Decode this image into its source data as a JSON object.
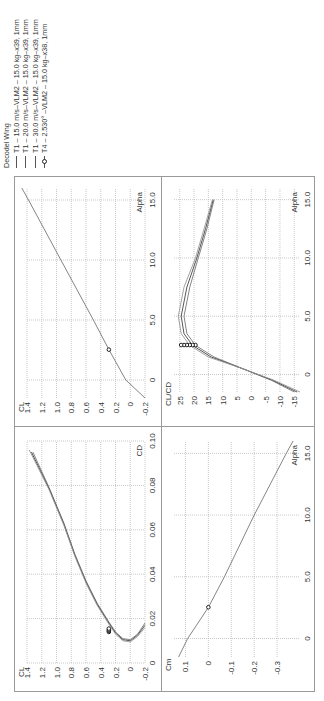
{
  "figure": {
    "orientation": "rotated 90 degrees counter-clockwise",
    "legend": {
      "title": "Decodel Wing",
      "entries": [
        {
          "label": "T1 – 15.0 m/s–VLM2 – 15.0 kg–x39, 1mm",
          "color": "#777777",
          "marker": "none"
        },
        {
          "label": "T1 – 20.0 m/s–VLM2 – 15.0 kg–x39, 1mm",
          "color": "#444444",
          "marker": "none"
        },
        {
          "label": "T1 – 30.0 m/s–VLM2 – 15.0 kg–x39, 1mm",
          "color": "#999999",
          "marker": "none"
        },
        {
          "label": "T4 – 2.530° –VLM2 – 15.0 kg–x38, 1mm",
          "color": "#222222",
          "marker": "circle"
        }
      ]
    }
  },
  "chart_data": [
    {
      "type": "line",
      "title": "CL vs CD (polar)",
      "xlabel": "CD",
      "ylabel": "CL",
      "xlim": [
        0,
        0.1
      ],
      "ylim": [
        -0.2,
        1.4
      ],
      "xticks": [
        "0",
        "0.02",
        "0.04",
        "0.06",
        "0.08",
        "0.10"
      ],
      "yticks": [
        "1.4",
        "1.2",
        "1.0",
        "0.8",
        "0.6",
        "0.4",
        "0.2",
        "0",
        "-0.2"
      ],
      "grid": true,
      "series": [
        {
          "name": "T1 – 15.0 m/s",
          "x": [
            0.018,
            0.013,
            0.0105,
            0.011,
            0.014,
            0.019,
            0.027,
            0.037,
            0.049,
            0.063,
            0.079,
            0.095
          ],
          "y": [
            -0.2,
            -0.1,
            0.0,
            0.1,
            0.2,
            0.3,
            0.45,
            0.6,
            0.75,
            0.9,
            1.1,
            1.32
          ]
        },
        {
          "name": "T1 – 20.0 m/s",
          "x": [
            0.017,
            0.0125,
            0.01,
            0.0105,
            0.0135,
            0.0185,
            0.0265,
            0.0365,
            0.0485,
            0.0625,
            0.0785,
            0.095
          ],
          "y": [
            -0.2,
            -0.1,
            0.0,
            0.1,
            0.2,
            0.3,
            0.45,
            0.6,
            0.75,
            0.9,
            1.1,
            1.34
          ]
        },
        {
          "name": "T1 – 30.0 m/s",
          "x": [
            0.016,
            0.012,
            0.0095,
            0.01,
            0.013,
            0.018,
            0.026,
            0.036,
            0.048,
            0.062,
            0.078,
            0.096
          ],
          "y": [
            -0.2,
            -0.1,
            0.0,
            0.1,
            0.2,
            0.3,
            0.45,
            0.6,
            0.75,
            0.9,
            1.1,
            1.37
          ]
        },
        {
          "name": "T4 – 2.530°",
          "x": [
            0.014,
            0.0145,
            0.015,
            0.0155
          ],
          "y": [
            0.29,
            0.29,
            0.29,
            0.29
          ],
          "marker": "circle"
        }
      ]
    },
    {
      "type": "line",
      "title": "CL vs Alpha",
      "xlabel": "Alpha",
      "ylabel": "CL",
      "xlim": [
        -1.5,
        16
      ],
      "ylim": [
        -0.2,
        1.4
      ],
      "xticks": [
        "0",
        "5.0",
        "10.0",
        "15.0"
      ],
      "yticks": [
        "1.4",
        "1.2",
        "1.0",
        "0.8",
        "0.6",
        "0.4",
        "0.2",
        "0",
        "-0.2"
      ],
      "grid": true,
      "series": [
        {
          "name": "T1 (all speeds)",
          "x": [
            -1.5,
            0,
            2.53,
            5,
            10,
            15,
            16
          ],
          "y": [
            -0.2,
            0.06,
            0.29,
            0.5,
            0.94,
            1.38,
            1.47
          ]
        },
        {
          "name": "T4 – 2.530°",
          "x": [
            2.53
          ],
          "y": [
            0.29
          ],
          "marker": "circle"
        }
      ]
    },
    {
      "type": "line",
      "title": "Cm vs Alpha",
      "xlabel": "Alpha",
      "ylabel": "Cm",
      "xlim": [
        -1.5,
        16
      ],
      "ylim": [
        -0.4,
        0.15
      ],
      "xticks": [
        "0",
        "5.0",
        "10.0",
        "15.0"
      ],
      "yticks": [
        "0.1",
        "0",
        "-0.1",
        "-0.2",
        "-0.3"
      ],
      "grid": true,
      "series": [
        {
          "name": "T1 (all speeds)",
          "x": [
            -1.5,
            0,
            2.53,
            5,
            10,
            15,
            16
          ],
          "y": [
            0.13,
            0.09,
            0.0,
            -0.07,
            -0.2,
            -0.34,
            -0.37
          ]
        },
        {
          "name": "T4 – 2.530°",
          "x": [
            2.53
          ],
          "y": [
            0.0
          ],
          "marker": "circle"
        }
      ]
    },
    {
      "type": "line",
      "title": "CL/CD vs Alpha",
      "xlabel": "Alpha",
      "ylabel": "CL/CD",
      "xlim": [
        -1.5,
        16
      ],
      "ylim": [
        -17,
        27
      ],
      "xticks": [
        "0",
        "5.0",
        "10.0",
        "15.0"
      ],
      "yticks": [
        "25",
        "20",
        "15",
        "10",
        "5",
        "0",
        "-5",
        "-10",
        "-15"
      ],
      "grid": true,
      "series": [
        {
          "name": "T1 – 15.0 m/s",
          "x": [
            -1.5,
            -0.5,
            0.5,
            1.5,
            2.5,
            3.5,
            5,
            7.5,
            10,
            12.5,
            15
          ],
          "y": [
            -15,
            -7,
            3,
            13,
            19.5,
            22.5,
            23.5,
            21.5,
            18.5,
            15.5,
            13
          ]
        },
        {
          "name": "T1 – 20.0 m/s",
          "x": [
            -1.5,
            -0.5,
            0.5,
            1.5,
            2.5,
            3.5,
            5,
            7.5,
            10,
            12.5,
            15
          ],
          "y": [
            -16,
            -7.5,
            3,
            14,
            20.5,
            23.5,
            24.5,
            22.5,
            19,
            16,
            13.3
          ]
        },
        {
          "name": "T1 – 30.0 m/s",
          "x": [
            -1.5,
            -0.5,
            0.5,
            1.5,
            2.5,
            3.5,
            5,
            7.5,
            10,
            12.5,
            15
          ],
          "y": [
            -17,
            -8,
            3,
            15,
            21.5,
            24.5,
            25.5,
            23.5,
            19.5,
            16.5,
            13.6
          ]
        },
        {
          "name": "T4 – 2.530°",
          "x": [
            2.53,
            2.53,
            2.53,
            2.53,
            2.53,
            2.53
          ],
          "y": [
            19.5,
            20.5,
            21.5,
            22.5,
            23.5,
            24.5
          ],
          "marker": "circle"
        }
      ]
    }
  ]
}
